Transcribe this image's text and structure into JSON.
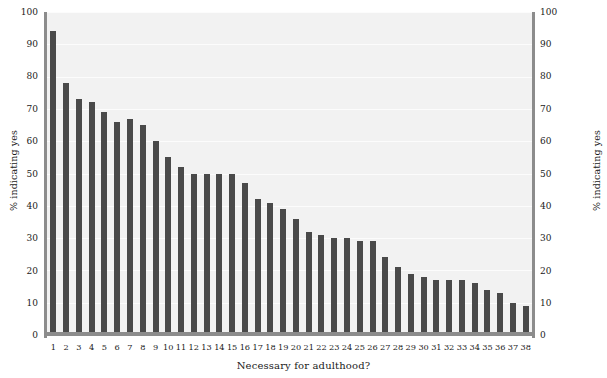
{
  "chart_data": {
    "type": "bar",
    "title": "",
    "xlabel": "Necessary for adulthood?",
    "ylabel": "% indicating yes",
    "ylabel_right": "% indicating yes",
    "ylim": [
      0,
      100
    ],
    "yticks": [
      0,
      10,
      20,
      30,
      40,
      50,
      60,
      70,
      80,
      90,
      100
    ],
    "grid": true,
    "grid_axis": "y",
    "legend": "none",
    "dual_y_axis": true,
    "categories": [
      "1",
      "2",
      "3",
      "4",
      "5",
      "6",
      "7",
      "8",
      "9",
      "10",
      "11",
      "12",
      "13",
      "14",
      "15",
      "16",
      "17",
      "18",
      "19",
      "20",
      "21",
      "22",
      "23",
      "24",
      "25",
      "26",
      "27",
      "28",
      "29",
      "30",
      "31",
      "32",
      "33",
      "34",
      "35",
      "36",
      "37",
      "38"
    ],
    "values": [
      94,
      78,
      73,
      72,
      69,
      66,
      67,
      65,
      60,
      55,
      52,
      50,
      50,
      50,
      50,
      47,
      42,
      41,
      39,
      36,
      32,
      31,
      30,
      30,
      29,
      29,
      24,
      21,
      19,
      18,
      17,
      17,
      17,
      16,
      14,
      13,
      10,
      9
    ],
    "colors": {
      "bar": "#4a4a4a",
      "plot_background": "#f2f2f2",
      "figure_background": "#ffffff",
      "gridline": "#ffffff",
      "spine": "#8c8c8c",
      "text": "#1a1a1a"
    }
  }
}
